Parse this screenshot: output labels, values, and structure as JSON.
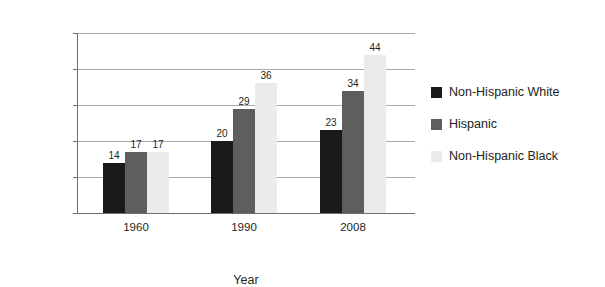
{
  "chart_data": {
    "type": "bar",
    "title": "",
    "xlabel": "Year",
    "ylabel": "Percent",
    "categories": [
      "1960",
      "1990",
      "2008"
    ],
    "series": [
      {
        "name": "Non-Hispanic White",
        "color": "#1a1a1a",
        "values": [
          14,
          20,
          23
        ]
      },
      {
        "name": "Hispanic",
        "color": "#5e5e5e",
        "values": [
          17,
          29,
          34
        ]
      },
      {
        "name": "Non-Hispanic Black",
        "color": "#ebebeb",
        "values": [
          17,
          36,
          44
        ]
      }
    ],
    "ylim": [
      0,
      50
    ],
    "yticks": [
      0,
      10,
      20,
      30,
      40,
      50
    ],
    "ytick_labels": [
      "0",
      "10",
      "20",
      "30",
      "40",
      "50"
    ],
    "grid": true,
    "legend_position": "right",
    "value_labels": true
  },
  "axes": {
    "y_title": "Percent",
    "x_title": "Year"
  },
  "legend": {
    "entries": [
      {
        "label": "Non-Hispanic White",
        "color": "#1a1a1a"
      },
      {
        "label": "Hispanic",
        "color": "#5e5e5e"
      },
      {
        "label": "Non-Hispanic Black",
        "color": "#ebebeb"
      }
    ]
  },
  "caption_remnant": ""
}
